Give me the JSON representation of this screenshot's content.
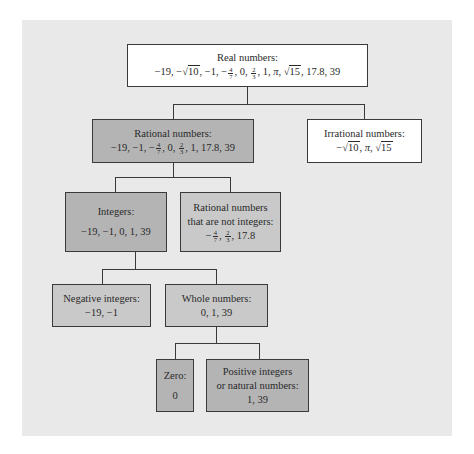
{
  "diagram": {
    "nodes": {
      "real": {
        "label": "Real numbers:",
        "members": [
          "−19",
          "−√10",
          "−1",
          "−4/7",
          "0",
          "2/3",
          "1",
          "π",
          "√15",
          "17.8",
          "39"
        ]
      },
      "rational": {
        "label": "Rational numbers:",
        "members": [
          "−19",
          "−1",
          "−4/7",
          "0",
          "2/3",
          "1",
          "17.8",
          "39"
        ]
      },
      "irrational": {
        "label": "Irrational numbers:",
        "members": [
          "−√10",
          "π",
          "√15"
        ]
      },
      "integers": {
        "label": "Integers:",
        "members_text": "−19, −1, 0, 1, 39"
      },
      "noninteger_rationals": {
        "label_line1": "Rational numbers",
        "label_line2": "that are not integers:",
        "members": [
          "−4/7",
          "2/3",
          "17.8"
        ]
      },
      "negative_integers": {
        "label": "Negative integers:",
        "members_text": "−19, −1"
      },
      "whole": {
        "label": "Whole numbers:",
        "members_text": "0, 1, 39"
      },
      "zero": {
        "label": "Zero:",
        "members_text": "0"
      },
      "positive": {
        "label_line1": "Positive integers",
        "label_line2": "or natural numbers:",
        "members_text": "1, 39"
      }
    },
    "edges": [
      [
        "real",
        "rational"
      ],
      [
        "real",
        "irrational"
      ],
      [
        "rational",
        "integers"
      ],
      [
        "rational",
        "noninteger_rationals"
      ],
      [
        "integers",
        "negative_integers"
      ],
      [
        "integers",
        "whole"
      ],
      [
        "whole",
        "zero"
      ],
      [
        "whole",
        "positive"
      ]
    ],
    "colors": {
      "panel": "#e9e9e9",
      "box_white": "#ffffff",
      "box_dark": "#b4b4b4",
      "box_light": "#c9c9c9",
      "line": "#3a3a3a"
    },
    "symbols": {
      "minus": "−",
      "comma": ", ",
      "pi": "π",
      "sqrt10": "10",
      "sqrt15": "15",
      "n4": "4",
      "d7": "7",
      "n2": "2",
      "d3": "3",
      "m19": "−19",
      "m1": "−1",
      "zero": "0",
      "one": "1",
      "v178": "17.8",
      "v39": "39"
    }
  }
}
